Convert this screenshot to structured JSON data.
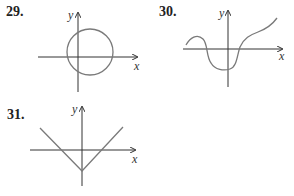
{
  "problems": [
    {
      "number": "29.",
      "description": "circle crossing both axes",
      "x_label": "x",
      "y_label": "y"
    },
    {
      "number": "30.",
      "description": "wavy curve crossing x-axis twice",
      "x_label": "x",
      "y_label": "y"
    },
    {
      "number": "31.",
      "description": "V-shaped graph with vertex below origin",
      "x_label": "x",
      "y_label": "y"
    }
  ],
  "colors": {
    "axis": "#333333",
    "curve": "#7a7a7a"
  }
}
